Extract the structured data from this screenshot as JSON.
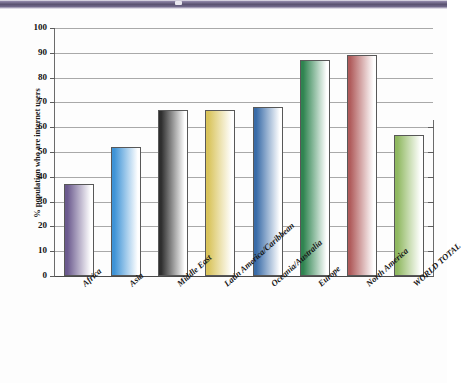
{
  "banner": {
    "name": "decorative-purple-banner",
    "color": "#5a5270"
  },
  "chart_data": {
    "type": "bar",
    "title": "",
    "xlabel": "",
    "ylabel": "% population who are internet users",
    "categories": [
      "Africa",
      "Asia",
      "Middle East",
      "Latin America/Caribbean",
      "Oceania/Australia",
      "Europe",
      "North America",
      "WORLD TOTAL"
    ],
    "values": [
      37,
      52,
      67,
      67,
      68,
      87,
      89,
      57
    ],
    "ylim": [
      0,
      100
    ],
    "ytick_labels": [
      "0",
      "10",
      "20",
      "30",
      "40",
      "50",
      "60",
      "70",
      "80",
      "90",
      "100"
    ],
    "ytick_values": [
      0,
      10,
      20,
      30,
      40,
      50,
      60,
      70,
      80,
      90,
      100
    ],
    "grid": true,
    "legend": "none",
    "bar_colors": [
      "#6b5a8e",
      "#3e93d6",
      "#2e2e2e",
      "#d9c45c",
      "#3a6ca8",
      "#2f8450",
      "#b05c5c",
      "#8fb860"
    ]
  }
}
